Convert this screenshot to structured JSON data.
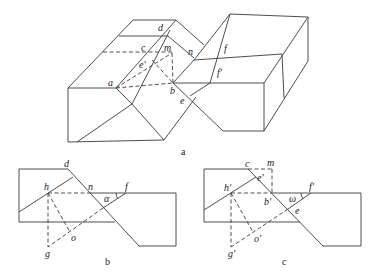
{
  "figures": [
    {
      "id": "a",
      "caption": "a",
      "labels": {
        "d": "d",
        "c": "c",
        "m": "m",
        "n": "n",
        "e_prime": "e'",
        "a": "a",
        "b": "b",
        "e": "e",
        "f": "f",
        "f_prime": "f'"
      }
    },
    {
      "id": "b",
      "caption": "b",
      "labels": {
        "d": "d",
        "h": "h",
        "n": "n",
        "f": "f",
        "alpha": "α",
        "o": "o",
        "g": "g"
      }
    },
    {
      "id": "c",
      "caption": "c",
      "labels": {
        "c": "c",
        "m": "m",
        "e_prime": "e'",
        "h_prime": "h'",
        "b_prime": "b'",
        "f_prime": "f'",
        "omega": "ω",
        "e": "e",
        "o_prime": "o'",
        "g_prime": "g'"
      }
    }
  ],
  "colors": {
    "line": "#3a3a3a",
    "background": "#ffffff"
  }
}
